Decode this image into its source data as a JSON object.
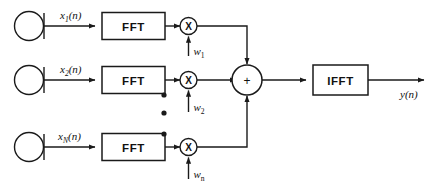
{
  "diagram": {
    "stroke_color": "#1a1a1a",
    "fill_color": "#ffffff",
    "background": "#ffffff",
    "channels": [
      {
        "id": "channel-1",
        "sensor_name": "sensor-circle",
        "input_label": "x",
        "input_subscript": "1",
        "input_suffix": "(n)",
        "transform_label": "FFT",
        "multiplier_glyph": "X",
        "weight_label": "w",
        "weight_subscript": "1"
      },
      {
        "id": "channel-2",
        "sensor_name": "sensor-circle",
        "input_label": "x",
        "input_subscript": "2",
        "input_suffix": "(n)",
        "transform_label": "FFT",
        "multiplier_glyph": "X",
        "weight_label": "w",
        "weight_subscript": "2"
      },
      {
        "id": "channel-n",
        "sensor_name": "sensor-circle",
        "input_label": "x",
        "input_subscript": "N",
        "input_suffix": "(n)",
        "transform_label": "FFT",
        "multiplier_glyph": "X",
        "weight_label": "w",
        "weight_subscript": "n"
      }
    ],
    "ellipsis": {
      "name": "vertical-ellipsis",
      "dot_count": 3
    },
    "summer": {
      "glyph": "+",
      "name": "summing-junction"
    },
    "inverse_transform": {
      "label": "IFFT"
    },
    "output": {
      "label": "y",
      "suffix": "(n)"
    }
  }
}
